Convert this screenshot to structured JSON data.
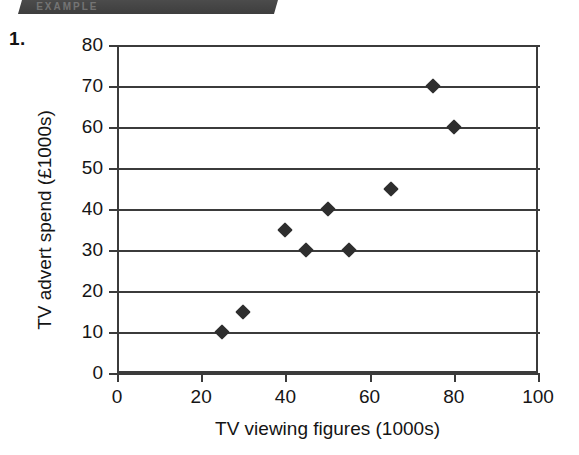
{
  "page": {
    "section_tab_text": "EXAMPLE",
    "question_number": "1."
  },
  "chart_data": {
    "type": "scatter",
    "title": "",
    "xlabel": "TV viewing figures (1000s)",
    "ylabel": "TV advert spend (£1000s)",
    "xlim": [
      0,
      100
    ],
    "ylim": [
      0,
      80
    ],
    "xticks": [
      0,
      20,
      40,
      60,
      80,
      100
    ],
    "yticks": [
      0,
      10,
      20,
      30,
      40,
      50,
      60,
      70,
      80
    ],
    "xtick_labels": [
      "0",
      "20",
      "40",
      "60",
      "80",
      "100"
    ],
    "ytick_labels": [
      "0",
      "10",
      "20",
      "30",
      "40",
      "50",
      "60",
      "70",
      "80"
    ],
    "grid": "horizontal",
    "legend": "none",
    "marker": "diamond",
    "marker_color": "#2e2e2e",
    "axis_color": "#3b3b3b",
    "points": [
      {
        "x": 25,
        "y": 10
      },
      {
        "x": 30,
        "y": 15
      },
      {
        "x": 40,
        "y": 35
      },
      {
        "x": 45,
        "y": 30
      },
      {
        "x": 50,
        "y": 40
      },
      {
        "x": 55,
        "y": 30
      },
      {
        "x": 65,
        "y": 45
      },
      {
        "x": 75,
        "y": 70
      },
      {
        "x": 80,
        "y": 60
      }
    ]
  }
}
